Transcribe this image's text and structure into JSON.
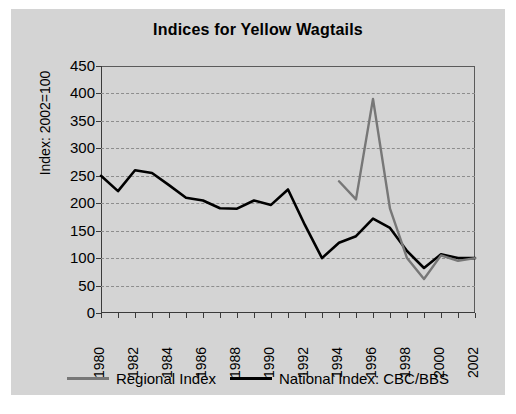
{
  "chart_data": {
    "type": "line",
    "title": "Indices for Yellow Wagtails",
    "xlabel": "",
    "ylabel": "Index: 2002=100",
    "xlim": [
      1980,
      2002
    ],
    "ylim": [
      0,
      450
    ],
    "yticks": [
      0,
      50,
      100,
      150,
      200,
      250,
      300,
      350,
      400,
      450
    ],
    "xticks": [
      1980,
      1982,
      1984,
      1986,
      1988,
      1990,
      1992,
      1994,
      1996,
      1998,
      2000,
      2002
    ],
    "x": [
      1980,
      1981,
      1982,
      1983,
      1984,
      1985,
      1986,
      1987,
      1988,
      1989,
      1990,
      1991,
      1992,
      1993,
      1994,
      1995,
      1996,
      1997,
      1998,
      1999,
      2000,
      2001,
      2002
    ],
    "grid": true,
    "legend_position": "bottom",
    "series": [
      {
        "name": "Regional Index",
        "color": "#777777",
        "x": [
          1994,
          1995,
          1996,
          1997,
          1998,
          1999,
          2000,
          2001,
          2002
        ],
        "values": [
          240,
          207,
          390,
          190,
          100,
          62,
          105,
          95,
          100
        ]
      },
      {
        "name": "National Index: CBC/BBS",
        "color": "#000000",
        "x": [
          1980,
          1981,
          1982,
          1983,
          1984,
          1985,
          1986,
          1987,
          1988,
          1989,
          1990,
          1991,
          1992,
          1993,
          1994,
          1995,
          1996,
          1997,
          1998,
          1999,
          2000,
          2001,
          2002
        ],
        "values": [
          250,
          222,
          260,
          255,
          233,
          210,
          205,
          191,
          190,
          205,
          197,
          225,
          160,
          100,
          128,
          140,
          172,
          155,
          113,
          82,
          107,
          100,
          100
        ]
      }
    ]
  },
  "legend": {
    "regional_label": "Regional Index",
    "national_label": "National Index: CBC/BBS"
  }
}
